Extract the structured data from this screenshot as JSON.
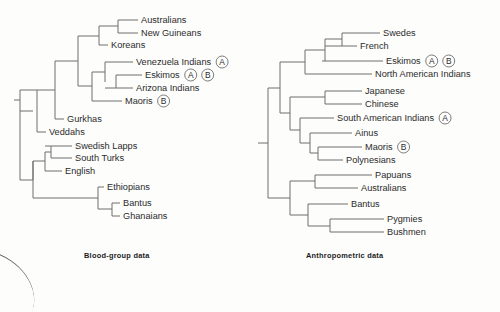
{
  "figure": {
    "background_color": "#fdfdfc",
    "line_color": "#6e6e6e",
    "text_color": "#2b2b2b"
  },
  "panels": [
    {
      "id": "blood-group",
      "caption": "Blood-group data",
      "leaves": [
        {
          "label": "Australians",
          "y": 20,
          "x": 138,
          "markers": []
        },
        {
          "label": "New Guineans",
          "y": 33,
          "x": 138,
          "markers": []
        },
        {
          "label": "Koreans",
          "y": 45,
          "x": 108,
          "markers": []
        },
        {
          "label": "Venezuela Indians",
          "y": 62,
          "x": 133,
          "markers": [
            "A"
          ]
        },
        {
          "label": "Eskimos",
          "y": 75,
          "x": 142,
          "markers": [
            "A",
            "B"
          ]
        },
        {
          "label": "Arizona Indians",
          "y": 88,
          "x": 133,
          "markers": []
        },
        {
          "label": "Maoris",
          "y": 101,
          "x": 122,
          "markers": [
            "B"
          ]
        },
        {
          "label": "Gurkhas",
          "y": 119,
          "x": 64,
          "markers": []
        },
        {
          "label": "Veddahs",
          "y": 132,
          "x": 46,
          "markers": []
        },
        {
          "label": "Swedish Lapps",
          "y": 146,
          "x": 72,
          "markers": []
        },
        {
          "label": "South Turks",
          "y": 158,
          "x": 72,
          "markers": []
        },
        {
          "label": "English",
          "y": 171,
          "x": 62,
          "markers": []
        },
        {
          "label": "Ethiopians",
          "y": 187,
          "x": 104,
          "markers": []
        },
        {
          "label": "Bantus",
          "y": 203,
          "x": 120,
          "markers": []
        },
        {
          "label": "Ghanaians",
          "y": 216,
          "x": 120,
          "markers": []
        }
      ]
    },
    {
      "id": "anthropometric",
      "caption": "Anthropometric data",
      "leaves": [
        {
          "label": "Swedes",
          "y": 33,
          "x": 380,
          "markers": []
        },
        {
          "label": "French",
          "y": 46,
          "x": 357,
          "markers": []
        },
        {
          "label": "Eskimos",
          "y": 61,
          "x": 383,
          "markers": [
            "A",
            "B"
          ]
        },
        {
          "label": "North American Indians",
          "y": 74,
          "x": 372,
          "markers": []
        },
        {
          "label": "Japanese",
          "y": 91,
          "x": 362,
          "markers": []
        },
        {
          "label": "Chinese",
          "y": 104,
          "x": 362,
          "markers": []
        },
        {
          "label": "South American Indians",
          "y": 118,
          "x": 334,
          "markers": [
            "A"
          ]
        },
        {
          "label": "Ainus",
          "y": 133,
          "x": 352,
          "markers": []
        },
        {
          "label": "Maoris",
          "y": 147,
          "x": 362,
          "markers": [
            "B"
          ]
        },
        {
          "label": "Polynesians",
          "y": 160,
          "x": 343,
          "markers": []
        },
        {
          "label": "Papuans",
          "y": 175,
          "x": 372,
          "markers": []
        },
        {
          "label": "Australians",
          "y": 188,
          "x": 358,
          "markers": []
        },
        {
          "label": "Bantus",
          "y": 204,
          "x": 348,
          "markers": []
        },
        {
          "label": "Pygmies",
          "y": 219,
          "x": 384,
          "markers": []
        },
        {
          "label": "Bushmen",
          "y": 232,
          "x": 384,
          "markers": []
        }
      ]
    }
  ]
}
